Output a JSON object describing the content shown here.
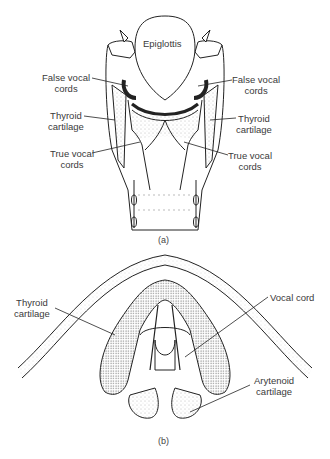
{
  "figure_a": {
    "caption": "(a)",
    "labels": {
      "epiglottis": "Epiglottis",
      "false_left_1": "False vocal",
      "false_left_2": "cords",
      "false_right_1": "False vocal",
      "false_right_2": "cords",
      "thyroid_left_1": "Thyroid",
      "thyroid_left_2": "cartilage",
      "thyroid_right_1": "Thyroid",
      "thyroid_right_2": "cartilage",
      "true_left_1": "True vocal",
      "true_left_2": "cords",
      "true_right_1": "True vocal",
      "true_right_2": "cords"
    }
  },
  "figure_b": {
    "caption": "(b)",
    "labels": {
      "thyroid_1": "Thyroid",
      "thyroid_2": "cartilage",
      "vocal_cord": "Vocal cord",
      "arytenoid_1": "Arytenoid",
      "arytenoid_2": "cartilage"
    }
  }
}
